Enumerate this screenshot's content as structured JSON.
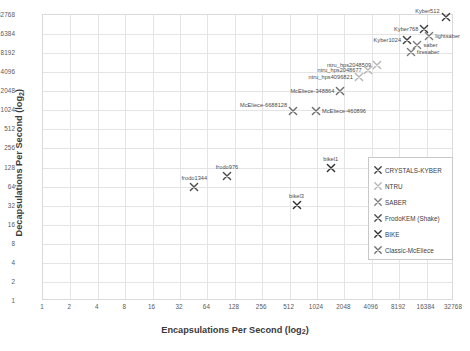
{
  "chart_data": {
    "type": "scatter",
    "title": "",
    "xlabel": "Encapsulations Per Second (log₂)",
    "ylabel": "Decapsulations Per Second (log₂)",
    "xlabel_main": "Encapsulations Per Second (log",
    "xlabel_sub": "2",
    "xlabel_tail": ")",
    "ylabel_main": "Decapsulations Per Second (log",
    "ylabel_sub": "2",
    "ylabel_tail": ")",
    "scale": "log2",
    "grid": true,
    "legend_position": "inside-right",
    "xticks": [
      "1",
      "2",
      "4",
      "8",
      "16",
      "32",
      "64",
      "128",
      "256",
      "512",
      "1024",
      "2048",
      "4096",
      "8192",
      "16384",
      "32768"
    ],
    "yticks": [
      "1",
      "2",
      "4",
      "8",
      "16",
      "32",
      "64",
      "128",
      "256",
      "512",
      "1024",
      "2048",
      "4096",
      "8192",
      "16384",
      "32768"
    ],
    "xlim": [
      1,
      32768
    ],
    "ylim": [
      1,
      32768
    ],
    "series": [
      {
        "name": "CRYSTALS-KYBER",
        "color": "#3f3f3f",
        "points": [
          {
            "label": "Kyber512",
            "x": 26500,
            "y": 30000,
            "lx": "left",
            "ly": "up"
          },
          {
            "label": "Kyber768",
            "x": 15500,
            "y": 20000,
            "lx": "left",
            "ly": "mid"
          },
          {
            "label": "Kyber1024",
            "x": 10000,
            "y": 13000,
            "lx": "left",
            "ly": "mid"
          }
        ]
      },
      {
        "name": "NTRU",
        "color": "#b6b6b6",
        "points": [
          {
            "label": "ntru_hps2048509",
            "x": 4700,
            "y": 5400,
            "lx": "left",
            "ly": "mid"
          },
          {
            "label": "ntru_hps2048677",
            "x": 3700,
            "y": 4400,
            "lx": "left",
            "ly": "mid"
          },
          {
            "label": "ntru_hps4096821",
            "x": 2950,
            "y": 3500,
            "lx": "left",
            "ly": "mid"
          }
        ]
      },
      {
        "name": "SABER",
        "color": "#7d7d7d",
        "points": [
          {
            "label": "lightsaber",
            "x": 17500,
            "y": 15000,
            "lx": "right",
            "ly": "mid"
          },
          {
            "label": "saber",
            "x": 13000,
            "y": 11000,
            "lx": "right",
            "ly": "mid"
          },
          {
            "label": "firesaber",
            "x": 11000,
            "y": 8600,
            "lx": "right",
            "ly": "mid"
          }
        ]
      },
      {
        "name": "FrodoKEM (Shake)",
        "color": "#4b4b4b",
        "points": [
          {
            "label": "frodo976",
            "x": 105,
            "y": 95,
            "lx": "center",
            "ly": "up"
          },
          {
            "label": "frodo1344",
            "x": 46,
            "y": 62,
            "lx": "center",
            "ly": "up"
          }
        ]
      },
      {
        "name": "BIKE",
        "color": "#2f2f2f",
        "points": [
          {
            "label": "bikel1",
            "x": 1450,
            "y": 125,
            "lx": "center",
            "ly": "up"
          },
          {
            "label": "bikel3",
            "x": 610,
            "y": 33,
            "lx": "center",
            "ly": "up"
          }
        ]
      },
      {
        "name": "Classic-McEliece",
        "color": "#6e6e6e",
        "points": [
          {
            "label": "McEliece-348864",
            "x": 1850,
            "y": 2050,
            "lx": "left",
            "ly": "mid"
          },
          {
            "label": "McEliece-6688128",
            "x": 560,
            "y": 1000,
            "lx": "left",
            "ly": "up"
          },
          {
            "label": "McEliece-460896",
            "x": 1000,
            "y": 1000,
            "lx": "right",
            "ly": "mid"
          }
        ]
      }
    ],
    "legend_entries": [
      {
        "label": "CRYSTALS-KYBER",
        "color": "#3f3f3f"
      },
      {
        "label": "NTRU",
        "color": "#b6b6b6"
      },
      {
        "label": "SABER",
        "color": "#7d7d7d"
      },
      {
        "label": "FrodoKEM (Shake)",
        "color": "#4b4b4b"
      },
      {
        "label": "BIKE",
        "color": "#2f2f2f"
      },
      {
        "label": "Classic-McEliece",
        "color": "#6e6e6e"
      }
    ]
  }
}
